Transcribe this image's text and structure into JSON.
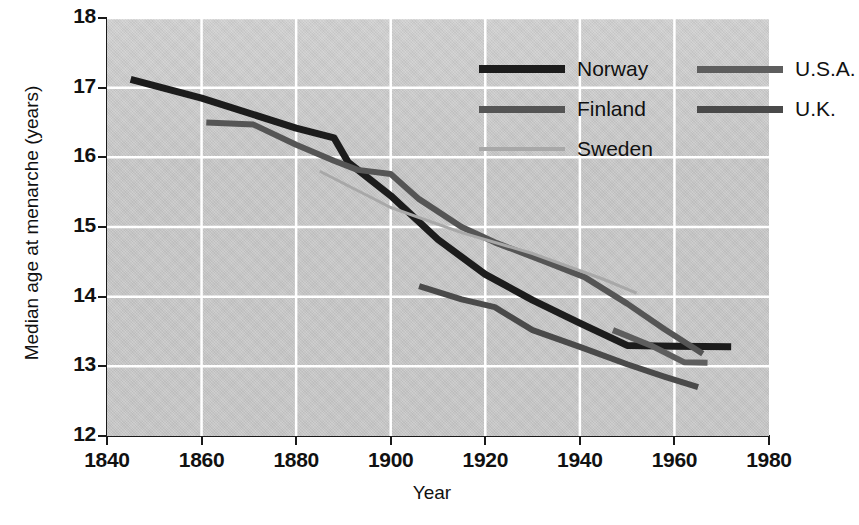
{
  "chart_data": {
    "type": "line",
    "title": "",
    "xlabel": "Year",
    "ylabel": "Median age at menarche (years)",
    "xlim": [
      1840,
      1980
    ],
    "ylim": [
      12,
      18
    ],
    "xticks": [
      1840,
      1860,
      1880,
      1900,
      1920,
      1940,
      1960,
      1980
    ],
    "yticks": [
      12,
      13,
      14,
      15,
      16,
      17,
      18
    ],
    "grid": true,
    "legend_position": "top-right-inside",
    "series": [
      {
        "name": "Norway",
        "color": "#1c1c1c",
        "width": 7,
        "points": [
          [
            1845,
            17.12
          ],
          [
            1860,
            16.85
          ],
          [
            1880,
            16.42
          ],
          [
            1888,
            16.28
          ],
          [
            1891,
            15.93
          ],
          [
            1900,
            15.45
          ],
          [
            1910,
            14.82
          ],
          [
            1920,
            14.32
          ],
          [
            1930,
            13.95
          ],
          [
            1940,
            13.62
          ],
          [
            1950,
            13.3
          ],
          [
            1960,
            13.29
          ],
          [
            1972,
            13.28
          ]
        ]
      },
      {
        "name": "Finland",
        "color": "#555555",
        "width": 6,
        "points": [
          [
            1861,
            16.5
          ],
          [
            1871,
            16.47
          ],
          [
            1880,
            16.18
          ],
          [
            1888,
            15.95
          ],
          [
            1893,
            15.82
          ],
          [
            1900,
            15.76
          ],
          [
            1906,
            15.4
          ],
          [
            1915,
            15.0
          ],
          [
            1922,
            14.78
          ],
          [
            1932,
            14.52
          ],
          [
            1941,
            14.28
          ],
          [
            1950,
            13.9
          ],
          [
            1958,
            13.53
          ],
          [
            1966,
            13.18
          ]
        ]
      },
      {
        "name": "Sweden",
        "color": "#a8a8a8",
        "width": 3,
        "points": [
          [
            1885,
            15.8
          ],
          [
            1900,
            15.28
          ],
          [
            1915,
            14.92
          ],
          [
            1930,
            14.62
          ],
          [
            1945,
            14.25
          ],
          [
            1952,
            14.05
          ]
        ]
      },
      {
        "name": "U.S.A.",
        "color": "#5e5e5e",
        "width": 6,
        "points": [
          [
            1947,
            13.52
          ],
          [
            1955,
            13.3
          ],
          [
            1962,
            13.06
          ],
          [
            1967,
            13.05
          ]
        ]
      },
      {
        "name": "U.K.",
        "color": "#4a4a4a",
        "width": 6,
        "points": [
          [
            1906,
            14.15
          ],
          [
            1915,
            13.96
          ],
          [
            1922,
            13.85
          ],
          [
            1930,
            13.52
          ],
          [
            1940,
            13.28
          ],
          [
            1950,
            13.03
          ],
          [
            1958,
            12.85
          ],
          [
            1965,
            12.7
          ]
        ]
      }
    ]
  },
  "axes": {
    "x_tick_labels": [
      "1840",
      "1860",
      "1880",
      "1900",
      "1920",
      "1940",
      "1960",
      "1980"
    ],
    "y_tick_labels": [
      "12",
      "13",
      "14",
      "15",
      "16",
      "17",
      "18"
    ],
    "x_title": "Year",
    "y_title": "Median age at menarche (years)"
  },
  "legend": {
    "entries": [
      {
        "label": "Norway",
        "color": "#1c1c1c",
        "width": 8
      },
      {
        "label": "Finland",
        "color": "#555555",
        "width": 7
      },
      {
        "label": "Sweden",
        "color": "#a8a8a8",
        "width": 4
      },
      {
        "label": "U.S.A.",
        "color": "#5e5e5e",
        "width": 7
      },
      {
        "label": "U.K.",
        "color": "#4a4a4a",
        "width": 7
      }
    ]
  },
  "colors": {
    "plot_background": "#c9c9c9",
    "grid": "#ffffff",
    "axis": "#1a1a1a",
    "page_background": "#ffffff"
  }
}
